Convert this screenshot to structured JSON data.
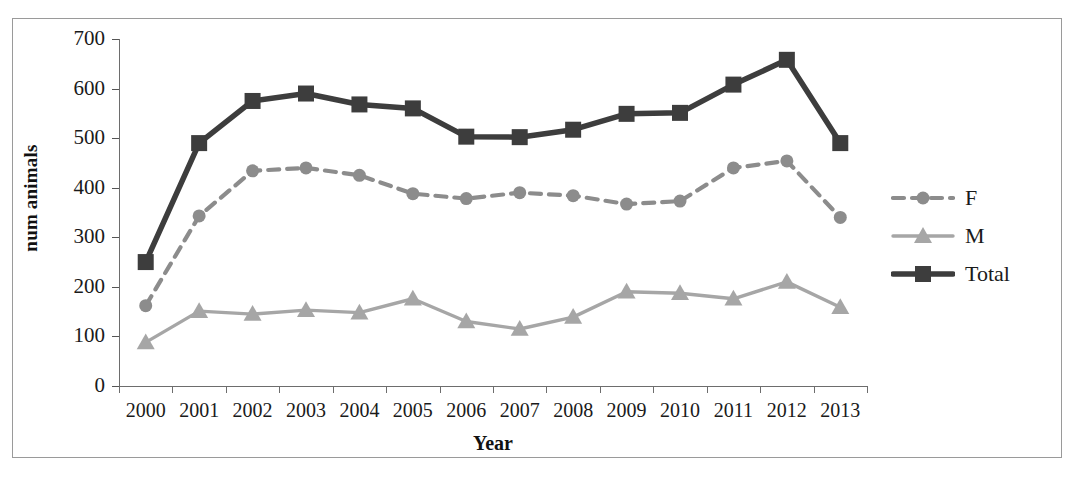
{
  "chart_data": {
    "type": "line",
    "title": "",
    "xlabel": "Year",
    "ylabel": "num animals",
    "categories": [
      "2000",
      "2001",
      "2002",
      "2003",
      "2004",
      "2005",
      "2006",
      "2007",
      "2008",
      "2009",
      "2010",
      "2011",
      "2012",
      "2013"
    ],
    "ylim": [
      0,
      700
    ],
    "yticks": [
      0,
      100,
      200,
      300,
      400,
      500,
      600,
      700
    ],
    "grid": false,
    "legend_position": "right",
    "series": [
      {
        "name": "F",
        "marker": "circle",
        "linestyle": "dashed",
        "color": "#8c8c8c",
        "values": [
          162,
          343,
          434,
          440,
          425,
          388,
          378,
          390,
          384,
          367,
          373,
          440,
          454,
          340
        ]
      },
      {
        "name": "M",
        "marker": "triangle",
        "linestyle": "solid",
        "color": "#a6a6a6",
        "values": [
          88,
          151,
          145,
          153,
          148,
          176,
          130,
          115,
          139,
          190,
          187,
          176,
          210,
          159
        ]
      },
      {
        "name": "Total",
        "marker": "square",
        "linestyle": "solid",
        "color": "#3d3d3d",
        "values": [
          250,
          490,
          575,
          590,
          568,
          560,
          503,
          502,
          517,
          549,
          551,
          608,
          658,
          490
        ]
      }
    ]
  },
  "legend": {
    "items": [
      {
        "label": "F"
      },
      {
        "label": "M"
      },
      {
        "label": "Total"
      }
    ]
  },
  "axes": {
    "x_title": "Year",
    "y_title": "num animals"
  },
  "colors": {
    "total": "#3d3d3d",
    "female": "#8c8c8c",
    "male": "#a6a6a6",
    "axis": "#6d6d6d",
    "frame": "#9a9a9a",
    "text": "#1a1a1a"
  }
}
